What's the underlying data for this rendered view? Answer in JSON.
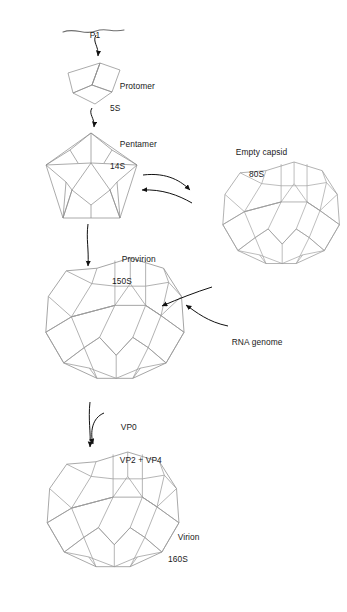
{
  "diagram": {
    "background": "#ffffff",
    "line_color": "#9a9a9a",
    "line_color_dark": "#7d7d7d",
    "arrow_color": "#111111",
    "text_color": "#1a1a1a"
  },
  "labels": {
    "p1": {
      "line1": "P1",
      "line2": ""
    },
    "protomer": {
      "line1": "Protomer",
      "line2": "5S"
    },
    "pentamer": {
      "line1": "Pentamer",
      "line2": "14S"
    },
    "empty_capsid": {
      "line1": "Empty capsid",
      "line2": "80S"
    },
    "provirion": {
      "line1": "Provirion",
      "line2": "150S"
    },
    "rna_genome": {
      "line1": "RNA genome",
      "line2": ""
    },
    "vp0": {
      "line1": "VP0",
      "line2": ""
    },
    "vp2_vp4": {
      "line1": "VP2 + VP4",
      "line2": ""
    },
    "virion": {
      "line1": "Virion",
      "line2": "160S"
    }
  },
  "stages": [
    {
      "name": "P1 polyprotein",
      "label": "P1",
      "sedimentation": ""
    },
    {
      "name": "Protomer",
      "label": "Protomer",
      "sedimentation": "5S"
    },
    {
      "name": "Pentamer",
      "label": "Pentamer",
      "sedimentation": "14S"
    },
    {
      "name": "Empty capsid",
      "label": "Empty capsid",
      "sedimentation": "80S"
    },
    {
      "name": "Provirion",
      "label": "Provirion",
      "sedimentation": "150S"
    },
    {
      "name": "Virion",
      "label": "Virion",
      "sedimentation": "160S"
    }
  ],
  "arrows": [
    {
      "name": "p1-to-protomer",
      "from": "P1",
      "to": "Protomer",
      "style": "curved-down"
    },
    {
      "name": "protomer-to-pentamer",
      "from": "Protomer",
      "to": "Pentamer",
      "style": "curved-down"
    },
    {
      "name": "pentamer-to-empty-capsid",
      "from": "Pentamer",
      "to": "Empty capsid",
      "style": "curved-right"
    },
    {
      "name": "empty-capsid-to-pentamer",
      "from": "Empty capsid",
      "to": "Pentamer",
      "style": "curved-left"
    },
    {
      "name": "pentamer-to-provirion",
      "from": "Pentamer",
      "to": "Provirion",
      "style": "straight-down"
    },
    {
      "name": "empty-capsid-to-provirion",
      "from": "Empty capsid",
      "to": "Provirion",
      "style": "curved-left"
    },
    {
      "name": "rna-genome-to-provirion",
      "from": "RNA genome",
      "to": "Provirion",
      "style": "curved-left"
    },
    {
      "name": "provirion-to-virion",
      "from": "Provirion",
      "to": "Virion",
      "style": "straight-down"
    },
    {
      "name": "vp0-cleavage",
      "from": "VP0",
      "to": "VP2 + VP4",
      "style": "curved-hook"
    }
  ]
}
